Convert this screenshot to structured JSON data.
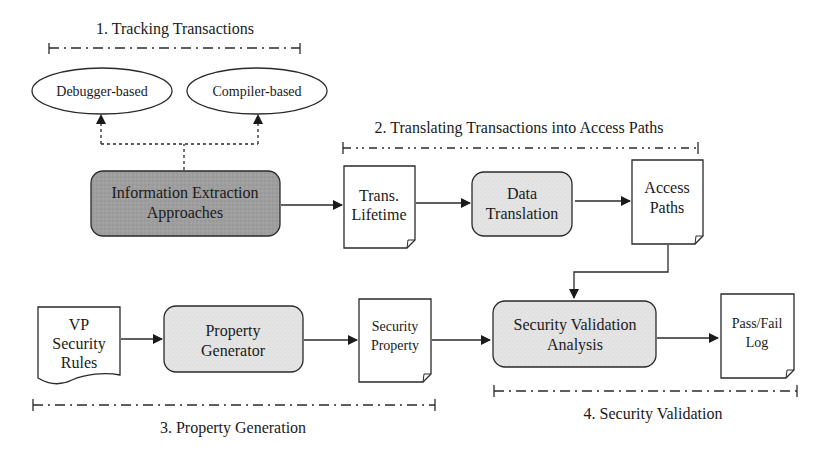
{
  "colors": {
    "stroke": "#2a2a2a",
    "dark_fill": "#9c9c9c",
    "light_fill": "#e4e4e4",
    "doc_fill": "#ffffff"
  },
  "stages": [
    {
      "label": "1. Tracking Transactions"
    },
    {
      "label": "2. Translating Transactions into Access Paths"
    },
    {
      "label": "3. Property Generation"
    },
    {
      "label": "4. Security Validation"
    }
  ],
  "ellipses": [
    {
      "label": "Debugger-based"
    },
    {
      "label": "Compiler-based"
    }
  ],
  "processes": {
    "info_extraction": {
      "line1": "Information Extraction",
      "line2": "Approaches"
    },
    "data_translation": {
      "line1": "Data",
      "line2": "Translation"
    },
    "property_generator": {
      "line1": "Property",
      "line2": "Generator"
    },
    "security_validation": {
      "line1": "Security Validation",
      "line2": "Analysis"
    }
  },
  "documents": {
    "trans_lifetime": {
      "line1": "Trans.",
      "line2": "Lifetime"
    },
    "access_paths": {
      "line1": "Access",
      "line2": "Paths"
    },
    "vp_rules": {
      "line1": "VP",
      "line2": "Security",
      "line3": "Rules"
    },
    "security_property": {
      "line1": "Security",
      "line2": "Property"
    },
    "pass_fail_log": {
      "line1": "Pass/Fail",
      "line2": "Log"
    }
  }
}
